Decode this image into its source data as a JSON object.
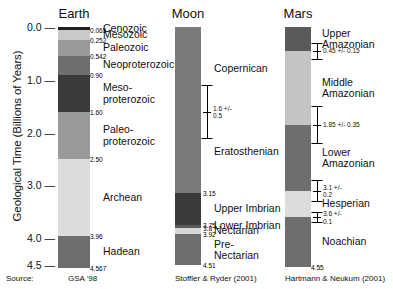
{
  "figure": {
    "ylabel": "Geological Time (Billions of Years)",
    "source_label": "Source:"
  },
  "chart_data": {
    "type": "bar",
    "title": "Geological Time (Billions of Years)",
    "ylabel": "Geological Time (Billions of Years)",
    "xlabel": "",
    "ylim": [
      0.0,
      4.6
    ],
    "yticks": [
      "0.0",
      "1.0",
      "2.0",
      "3.0",
      "4.0",
      "4.5"
    ],
    "ytick_values": [
      0.0,
      1.0,
      2.0,
      3.0,
      4.0,
      4.5
    ],
    "grid": false,
    "legend": "none",
    "columns": [
      {
        "name": "Earth",
        "title": "Earth",
        "source": "GSA '98",
        "base_age": 4.567,
        "bands": [
          {
            "label": "Cenozoic",
            "top": 0.0,
            "bottom": 0.065,
            "color": "#231f20",
            "boundary": "0.065"
          },
          {
            "label": "Mesozoic",
            "top": 0.065,
            "bottom": 0.252,
            "color": "#c9c9c9",
            "boundary": "0.252"
          },
          {
            "label": "Paleozoic",
            "top": 0.252,
            "bottom": 0.542,
            "color": "#9a9a9a",
            "boundary": "0.542"
          },
          {
            "label": "Neoproterozoic",
            "top": 0.542,
            "bottom": 0.9,
            "color": "#6e6e6e",
            "boundary": "0.90"
          },
          {
            "label": "Meso-\nproterozoic",
            "top": 0.9,
            "bottom": 1.6,
            "color": "#3b3b3b",
            "boundary": "1.60"
          },
          {
            "label": "Paleo-\nproterozoic",
            "top": 1.6,
            "bottom": 2.5,
            "color": "#9a9a9a",
            "boundary": "2.50"
          },
          {
            "label": "Archean",
            "top": 2.5,
            "bottom": 3.96,
            "color": "#dcdcdc",
            "boundary": "3.96"
          },
          {
            "label": "Hadean",
            "top": 3.96,
            "bottom": 4.567,
            "color": "#6e6e6e",
            "boundary": "4.567"
          }
        ],
        "errorbars": []
      },
      {
        "name": "Moon",
        "title": "Moon",
        "source": "Stoffler & Ryder (2001)",
        "base_age": 4.51,
        "bands": [
          {
            "label": "Copernican",
            "top": 0.0,
            "bottom": 1.6,
            "color": "#7a7a7a",
            "boundary": ""
          },
          {
            "label": "Eratosthenian",
            "top": 1.6,
            "bottom": 3.15,
            "color": "#7a7a7a",
            "boundary": "3.15"
          },
          {
            "label": "Upper Imbrian",
            "top": 3.15,
            "bottom": 3.75,
            "color": "#3b3b3b",
            "boundary": "3.75"
          },
          {
            "label": "Lower Imbrian",
            "top": 3.75,
            "bottom": 3.8,
            "color": "#5a5a5a",
            "boundary": "3.8"
          },
          {
            "label": "Nectarian",
            "top": 3.8,
            "bottom": 3.92,
            "color": "#d6d6d6",
            "boundary": "3.92"
          },
          {
            "label": "Pre-\nNectarian",
            "top": 3.92,
            "bottom": 4.51,
            "color": "#6e6e6e",
            "boundary": "4.51"
          }
        ],
        "errorbars": [
          {
            "value": 1.6,
            "plus_minus": 0.5,
            "text": "1.6 +/-\n0.5"
          }
        ]
      },
      {
        "name": "Mars",
        "title": "Mars",
        "source": "Hartmann & Neukum (2001)",
        "base_age": 4.55,
        "bands": [
          {
            "label": "Upper\nAmazonian",
            "top": 0.0,
            "bottom": 0.45,
            "color": "#5a5a5a",
            "boundary": ""
          },
          {
            "label": "Middle\nAmazonian",
            "top": 0.45,
            "bottom": 1.85,
            "color": "#c4c4c4",
            "boundary": ""
          },
          {
            "label": "Lower\nAmazonian",
            "top": 1.85,
            "bottom": 3.1,
            "color": "#6e6e6e",
            "boundary": ""
          },
          {
            "label": "Hesperian",
            "top": 3.1,
            "bottom": 3.6,
            "color": "#dcdcdc",
            "boundary": ""
          },
          {
            "label": "Noachian",
            "top": 3.6,
            "bottom": 4.55,
            "color": "#6e6e6e",
            "boundary": "4.55"
          }
        ],
        "errorbars": [
          {
            "value": 0.45,
            "plus_minus": 0.15,
            "text": "0.45 +/- 0.15"
          },
          {
            "value": 1.85,
            "plus_minus": 0.35,
            "text": "1.85 +/- 0.35"
          },
          {
            "value": 3.1,
            "plus_minus": 0.2,
            "text": "3.1 +/-\n0.2"
          },
          {
            "value": 3.6,
            "plus_minus": 0.1,
            "text": "3.6 +/-\n0.1"
          }
        ]
      }
    ]
  }
}
